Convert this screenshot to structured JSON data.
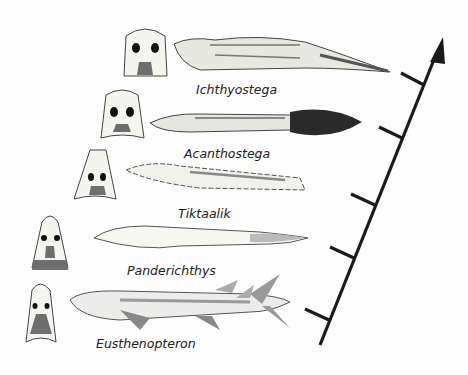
{
  "diagram": {
    "type": "evolutionary-sequence",
    "axis": {
      "direction": "up",
      "ticks": 5
    },
    "taxa": [
      {
        "name": "Ichthyostega",
        "order": 5
      },
      {
        "name": "Acanthostega",
        "order": 4
      },
      {
        "name": "Tiktaalik",
        "order": 3
      },
      {
        "name": "Panderichthys",
        "order": 2
      },
      {
        "name": "Eusthenopteron",
        "order": 1
      }
    ],
    "colors": {
      "line": "#1a1a1a",
      "skull_fill": "#f5f5f0",
      "skull_shade": "#6e6e6e",
      "outline": "#444444"
    }
  }
}
